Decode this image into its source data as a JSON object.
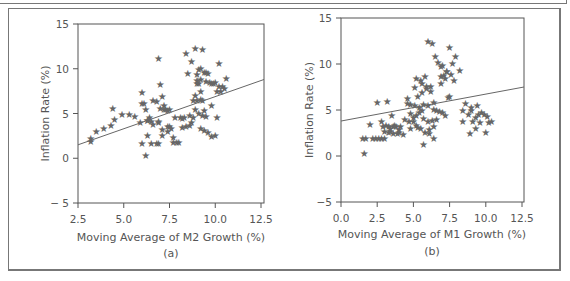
{
  "chart_data": [
    {
      "type": "scatter",
      "panel_label": "(a)",
      "title": "",
      "xlabel": "Moving Average of M2 Growth (%)",
      "ylabel": "Inflation Rate (%)",
      "xlim": [
        2.5,
        12.5
      ],
      "ylim": [
        -5,
        15
      ],
      "xticks": [
        "2.5",
        "5.0",
        "7.5",
        "10.0",
        "12.5"
      ],
      "yticks": [
        "15",
        "10",
        "5",
        "0",
        "− 5"
      ],
      "grid": false,
      "marker": "star",
      "regression_line": {
        "x": [
          2.5,
          12.5
        ],
        "y": [
          1.5,
          8.8
        ]
      },
      "points": {
        "x": [
          3.2,
          3.2,
          3.5,
          3.9,
          4.3,
          4.5,
          4.4,
          4.9,
          5.3,
          5.6,
          5.9,
          6.0,
          6.1,
          6.2,
          6.3,
          6.0,
          6.2,
          6.5,
          6.8,
          6.9,
          6.9,
          7.0,
          7.1,
          7.2,
          7.3,
          7.5,
          7.4,
          7.2,
          7.0,
          6.8,
          6.6,
          6.5,
          6.3,
          6.4,
          6.9,
          7.1,
          7.4,
          7.6,
          7.7,
          7.9,
          8.0,
          8.1,
          8.2,
          8.3,
          8.2,
          8.4,
          8.6,
          8.8,
          8.6,
          8.7,
          8.5,
          8.4,
          8.7,
          8.9,
          9.0,
          9.1,
          9.2,
          9.3,
          9.4,
          9.5,
          9.0,
          9.1,
          9.2,
          9.3,
          9.4,
          9.0,
          8.9,
          9.1,
          9.3,
          9.5,
          9.2,
          9.4,
          9.6,
          9.8,
          10.0,
          10.2,
          10.4,
          10.5,
          10.3,
          10.1,
          9.9,
          9.7,
          9.5,
          9.8,
          10.0,
          9.2,
          9.0,
          9.6,
          10.2,
          10.6,
          6.3,
          7.1,
          6.9,
          7.7,
          8.8,
          8.9,
          9.2,
          9.8,
          10.1,
          7.8,
          7.4,
          6.0,
          6.6,
          7.5
        ],
        "y": [
          2.2,
          1.9,
          3.0,
          3.3,
          3.7,
          4.3,
          5.6,
          4.9,
          4.9,
          4.7,
          4.0,
          7.3,
          6.1,
          5.5,
          2.5,
          1.7,
          0.3,
          1.7,
          1.6,
          1.6,
          11.1,
          8.2,
          6.9,
          5.9,
          5.5,
          5.5,
          5.3,
          5.4,
          5.6,
          6.3,
          6.4,
          4.1,
          4.2,
          4.6,
          4.0,
          3.2,
          3.0,
          3.3,
          1.8,
          1.8,
          1.8,
          4.5,
          4.4,
          4.5,
          3.4,
          3.6,
          3.7,
          4.6,
          4.8,
          4.0,
          9.5,
          11.7,
          10.8,
          12.3,
          9.4,
          9.9,
          10.0,
          12.2,
          9.6,
          9.6,
          8.3,
          8.4,
          6.6,
          6.5,
          5.3,
          6.5,
          5.5,
          5.0,
          4.8,
          4.7,
          3.3,
          3.1,
          2.9,
          2.4,
          2.5,
          8.0,
          8.0,
          7.8,
          7.5,
          7.5,
          8.3,
          8.5,
          8.6,
          8.4,
          8.5,
          8.8,
          8.7,
          9.5,
          10.6,
          8.9,
          4.2,
          2.5,
          4.1,
          2.3,
          6.4,
          7.0,
          7.5,
          5.9,
          4.5,
          4.6,
          3.6,
          6.1,
          3.8,
          3.5
        ]
      }
    },
    {
      "type": "scatter",
      "panel_label": "(b)",
      "title": "",
      "xlabel": "Moving Average of M1 Growth (%)",
      "ylabel": "Inflation Rate (%)",
      "xlim": [
        0.0,
        12.5
      ],
      "ylim": [
        -5,
        15
      ],
      "xticks": [
        "0.0",
        "2.5",
        "5.0",
        "7.5",
        "10.0",
        "12.5"
      ],
      "yticks": [
        "15",
        "10",
        "5",
        "0",
        "−5"
      ],
      "grid": false,
      "marker": "star",
      "regression_line": {
        "x": [
          0.0,
          12.5
        ],
        "y": [
          3.8,
          7.5
        ]
      },
      "points": {
        "x": [
          1.5,
          1.6,
          1.7,
          2.2,
          2.4,
          2.6,
          2.8,
          3.0,
          3.3,
          3.6,
          3.8,
          4.1,
          2.0,
          2.5,
          2.9,
          3.1,
          3.4,
          3.7,
          4.0,
          3.3,
          3.6,
          3.9,
          3.2,
          3.5,
          2.8,
          3.0,
          3.4,
          4.0,
          4.3,
          4.6,
          4.6,
          4.8,
          5.1,
          5.4,
          5.7,
          6.0,
          4.4,
          4.7,
          5.0,
          5.2,
          5.5,
          5.8,
          6.1,
          6.4,
          5.1,
          5.3,
          5.6,
          5.9,
          6.2,
          4.8,
          5.0,
          5.2,
          5.4,
          5.6,
          5.2,
          5.5,
          5.8,
          5.6,
          5.9,
          6.2,
          6.0,
          6.3,
          6.5,
          6.7,
          6.9,
          7.1,
          7.3,
          6.4,
          6.6,
          6.8,
          7.0,
          7.2,
          5.7,
          6.0,
          6.3,
          6.6,
          7.5,
          6.9,
          7.2,
          7.0,
          7.3,
          7.6,
          7.8,
          7.5,
          7.7,
          7.9,
          8.2,
          6.4,
          8.4,
          8.8,
          9.0,
          9.3,
          9.5,
          9.7,
          9.9,
          10.1,
          8.6,
          9.0,
          9.4,
          9.1,
          9.6,
          9.3,
          10.0,
          10.4,
          10.2,
          8.4,
          8.9,
          5.7,
          4.8,
          5.3,
          6.1,
          6.4,
          7.4,
          6.9
        ],
        "y": [
          1.9,
          0.3,
          1.9,
          1.9,
          1.9,
          1.9,
          1.9,
          1.9,
          3.2,
          3.2,
          3.2,
          3.2,
          3.4,
          5.8,
          3.2,
          3.3,
          3.0,
          3.3,
          2.9,
          2.6,
          2.4,
          2.5,
          5.9,
          4.4,
          3.7,
          2.7,
          2.7,
          2.6,
          2.3,
          6.2,
          5.7,
          5.6,
          5.5,
          5.3,
          5.6,
          5.5,
          4.0,
          3.7,
          3.7,
          3.3,
          3.0,
          2.6,
          2.4,
          1.9,
          7.4,
          6.5,
          6.9,
          7.6,
          7.0,
          4.6,
          4.2,
          4.4,
          4.7,
          5.0,
          8.4,
          8.2,
          8.6,
          7.9,
          7.3,
          7.6,
          12.5,
          12.2,
          10.8,
          10.2,
          9.7,
          8.8,
          9.2,
          5.1,
          5.0,
          4.8,
          4.7,
          4.4,
          4.1,
          3.7,
          3.9,
          4.0,
          6.5,
          8.6,
          8.4,
          9.8,
          9.2,
          8.9,
          8.2,
          11.8,
          10.1,
          10.8,
          9.3,
          5.8,
          4.9,
          4.5,
          4.9,
          4.2,
          4.5,
          4.7,
          4.5,
          4.3,
          5.7,
          5.3,
          5.5,
          3.8,
          3.6,
          3.0,
          2.6,
          3.8,
          3.6,
          3.8,
          2.4,
          1.2,
          3.0,
          3.1,
          2.9,
          3.2,
          6.4,
          7.9
        ]
      }
    }
  ]
}
